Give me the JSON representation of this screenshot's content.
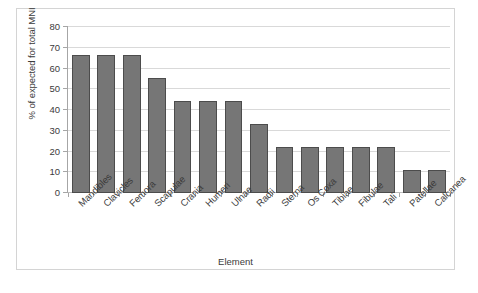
{
  "chart_data": {
    "type": "bar",
    "title": "",
    "xlabel": "Element",
    "ylabel": "% of expected for total MNI",
    "categories": [
      "Mandibles",
      "Clavicles",
      "Femora",
      "Scapulae",
      "Crania",
      "Humeri",
      "Ulnae",
      "Radii",
      "Sterna",
      "Os Coxa",
      "Tibiae",
      "Fibulae",
      "Tali",
      "Patellae",
      "Calcanea"
    ],
    "values": [
      66.7,
      66.7,
      66.7,
      55.6,
      44.4,
      44.4,
      44.4,
      33.3,
      22.2,
      22.2,
      22.2,
      22.2,
      22.2,
      11.1,
      11.1
    ],
    "ylim": [
      0,
      80
    ],
    "ytick_labels": [
      "0",
      "10",
      "20",
      "30",
      "40",
      "50",
      "60",
      "70",
      "80"
    ],
    "ytick_values": [
      0,
      10,
      20,
      30,
      40,
      50,
      60,
      70,
      80
    ],
    "grid": true,
    "legend": false,
    "bar_color": "#767676",
    "bar_edge_color": "#4c4c4c",
    "gridline_color": "#d9d9d9",
    "axis_color": "#a6a6a6",
    "frame_color": "#d4d4d4",
    "text_color": "#3b3b3b",
    "background": "#ffffff"
  }
}
